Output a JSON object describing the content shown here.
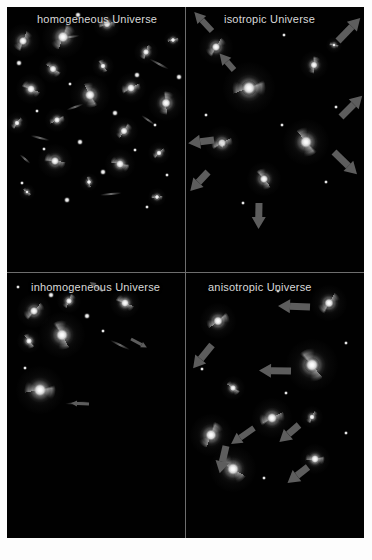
{
  "figure": {
    "background_color": "#000000",
    "frame_color": "#fdfdfd",
    "divider_color": "#6e6e6e",
    "arrow_color": "#5d5d5d",
    "label_color": "#d8d8d8"
  },
  "panels": [
    {
      "id": "homogeneous",
      "label": "homogeneous Universe",
      "galaxies": [
        {
          "x": 16,
          "y": 34,
          "r": 11,
          "rot": 20
        },
        {
          "x": 56,
          "y": 30,
          "r": 14,
          "rot": 200
        },
        {
          "x": 100,
          "y": 17,
          "r": 9,
          "rot": 70
        },
        {
          "x": 96,
          "y": 59,
          "r": 7,
          "rot": 140
        },
        {
          "x": 46,
          "y": 62,
          "r": 9,
          "rot": 300
        },
        {
          "x": 139,
          "y": 45,
          "r": 8,
          "rot": 15
        },
        {
          "x": 166,
          "y": 33,
          "r": 6,
          "rot": 250
        },
        {
          "x": 24,
          "y": 82,
          "r": 10,
          "rot": 110
        },
        {
          "x": 83,
          "y": 88,
          "r": 13,
          "rot": 330
        },
        {
          "x": 124,
          "y": 81,
          "r": 10,
          "rot": 60
        },
        {
          "x": 159,
          "y": 96,
          "r": 12,
          "rot": 175
        },
        {
          "x": 50,
          "y": 113,
          "r": 8,
          "rot": 240
        },
        {
          "x": 10,
          "y": 116,
          "r": 7,
          "rot": 30
        },
        {
          "x": 117,
          "y": 124,
          "r": 9,
          "rot": 210
        },
        {
          "x": 48,
          "y": 154,
          "r": 11,
          "rot": 95
        },
        {
          "x": 113,
          "y": 157,
          "r": 10,
          "rot": 280
        },
        {
          "x": 152,
          "y": 146,
          "r": 7,
          "rot": 40
        },
        {
          "x": 82,
          "y": 175,
          "r": 6,
          "rot": 160
        },
        {
          "x": 20,
          "y": 185,
          "r": 5,
          "rot": 300
        },
        {
          "x": 150,
          "y": 190,
          "r": 6,
          "rot": 80
        }
      ],
      "stars": [
        {
          "x": 71,
          "y": 8,
          "s": 3
        },
        {
          "x": 12,
          "y": 56,
          "s": 3
        },
        {
          "x": 130,
          "y": 68,
          "s": 3
        },
        {
          "x": 63,
          "y": 77,
          "s": 2
        },
        {
          "x": 172,
          "y": 70,
          "s": 3
        },
        {
          "x": 30,
          "y": 104,
          "s": 2
        },
        {
          "x": 108,
          "y": 106,
          "s": 3
        },
        {
          "x": 148,
          "y": 118,
          "s": 2
        },
        {
          "x": 73,
          "y": 135,
          "s": 3
        },
        {
          "x": 37,
          "y": 142,
          "s": 2
        },
        {
          "x": 128,
          "y": 143,
          "s": 2
        },
        {
          "x": 96,
          "y": 165,
          "s": 3
        },
        {
          "x": 160,
          "y": 168,
          "s": 2
        },
        {
          "x": 15,
          "y": 176,
          "s": 2
        },
        {
          "x": 60,
          "y": 193,
          "s": 3
        },
        {
          "x": 140,
          "y": 200,
          "s": 2
        }
      ],
      "streaks": [
        {
          "x": 63,
          "y": 30,
          "len": 20,
          "rot": -8
        },
        {
          "x": 152,
          "y": 57,
          "len": 22,
          "rot": 28
        },
        {
          "x": 68,
          "y": 100,
          "len": 18,
          "rot": -20
        },
        {
          "x": 33,
          "y": 131,
          "len": 20,
          "rot": 14
        },
        {
          "x": 141,
          "y": 113,
          "len": 16,
          "rot": 35
        },
        {
          "x": 104,
          "y": 187,
          "len": 22,
          "rot": -6
        },
        {
          "x": 18,
          "y": 152,
          "len": 14,
          "rot": 40
        }
      ],
      "arrows": []
    },
    {
      "id": "isotropic",
      "label": "isotropic Universe",
      "galaxies": [
        {
          "x": 30,
          "y": 40,
          "r": 11,
          "rot": 30
        },
        {
          "x": 128,
          "y": 58,
          "r": 9,
          "rot": 180
        },
        {
          "x": 63,
          "y": 81,
          "r": 17,
          "rot": 250
        },
        {
          "x": 36,
          "y": 136,
          "r": 11,
          "rot": 60
        },
        {
          "x": 120,
          "y": 135,
          "r": 15,
          "rot": 320
        },
        {
          "x": 78,
          "y": 172,
          "r": 11,
          "rot": 140
        },
        {
          "x": 37,
          "y": 137,
          "r": 4,
          "rot": 0
        },
        {
          "x": 148,
          "y": 38,
          "r": 5,
          "rot": 90
        }
      ],
      "stars": [
        {
          "x": 98,
          "y": 28,
          "s": 2
        },
        {
          "x": 150,
          "y": 100,
          "s": 2
        },
        {
          "x": 20,
          "y": 108,
          "s": 2
        },
        {
          "x": 96,
          "y": 118,
          "s": 2
        },
        {
          "x": 140,
          "y": 175,
          "s": 2
        },
        {
          "x": 57,
          "y": 196,
          "s": 2
        }
      ],
      "streaks": [],
      "arrows": [
        {
          "x": 26,
          "y": 24,
          "len": 26,
          "rot": -133,
          "w": 6,
          "hw": 11
        },
        {
          "x": 152,
          "y": 34,
          "len": 32,
          "rot": -46,
          "w": 7,
          "hw": 12
        },
        {
          "x": 48,
          "y": 63,
          "len": 22,
          "rot": -131,
          "w": 6,
          "hw": 11
        },
        {
          "x": 155,
          "y": 110,
          "len": 30,
          "rot": -45,
          "w": 7,
          "hw": 12
        },
        {
          "x": 28,
          "y": 133,
          "len": 26,
          "rot": 173,
          "w": 7,
          "hw": 12
        },
        {
          "x": 22,
          "y": 165,
          "len": 26,
          "rot": 133,
          "w": 7,
          "hw": 12
        },
        {
          "x": 148,
          "y": 145,
          "len": 32,
          "rot": 44,
          "w": 7,
          "hw": 12
        },
        {
          "x": 73,
          "y": 196,
          "len": 26,
          "rot": 91,
          "w": 7,
          "hw": 12
        }
      ]
    },
    {
      "id": "inhomogeneous",
      "label": "inhomogeneous Universe",
      "galaxies": [
        {
          "x": 27,
          "y": 38,
          "r": 11,
          "rot": 40
        },
        {
          "x": 62,
          "y": 28,
          "r": 8,
          "rot": 200
        },
        {
          "x": 118,
          "y": 30,
          "r": 10,
          "rot": 110
        },
        {
          "x": 22,
          "y": 68,
          "r": 8,
          "rot": 320
        },
        {
          "x": 55,
          "y": 62,
          "r": 15,
          "rot": 150
        },
        {
          "x": 33,
          "y": 117,
          "r": 16,
          "rot": 260
        }
      ],
      "stars": [
        {
          "x": 44,
          "y": 22,
          "s": 3
        },
        {
          "x": 80,
          "y": 43,
          "s": 3
        },
        {
          "x": 11,
          "y": 14,
          "s": 2
        },
        {
          "x": 96,
          "y": 58,
          "s": 2
        },
        {
          "x": 18,
          "y": 95,
          "s": 2
        }
      ],
      "streaks": [
        {
          "x": 113,
          "y": 72,
          "len": 22,
          "rot": 26
        },
        {
          "x": 70,
          "y": 130,
          "len": 24,
          "rot": -4
        }
      ],
      "arrows": [
        {
          "x": 124,
          "y": 66,
          "len": 18,
          "rot": 28,
          "w": 3,
          "hw": 6
        },
        {
          "x": 82,
          "y": 131,
          "len": 18,
          "rot": 182,
          "w": 3,
          "hw": 6
        },
        {
          "x": 96,
          "y": 18,
          "len": 16,
          "rot": 214,
          "w": 3,
          "hw": 6
        }
      ]
    },
    {
      "id": "anisotropic",
      "label": "anisotropic Universe",
      "galaxies": [
        {
          "x": 143,
          "y": 30,
          "r": 12,
          "rot": 30
        },
        {
          "x": 32,
          "y": 48,
          "r": 12,
          "rot": 230
        },
        {
          "x": 126,
          "y": 92,
          "r": 17,
          "rot": 140
        },
        {
          "x": 47,
          "y": 115,
          "r": 8,
          "rot": 300
        },
        {
          "x": 86,
          "y": 145,
          "r": 13,
          "rot": 60
        },
        {
          "x": 25,
          "y": 162,
          "r": 14,
          "rot": 200
        },
        {
          "x": 126,
          "y": 144,
          "r": 7,
          "rot": 20
        },
        {
          "x": 47,
          "y": 196,
          "r": 15,
          "rot": 120
        },
        {
          "x": 129,
          "y": 186,
          "r": 10,
          "rot": 260
        }
      ],
      "stars": [
        {
          "x": 92,
          "y": 18,
          "s": 2
        },
        {
          "x": 160,
          "y": 70,
          "s": 2
        },
        {
          "x": 16,
          "y": 96,
          "s": 2
        },
        {
          "x": 100,
          "y": 120,
          "s": 2
        },
        {
          "x": 160,
          "y": 160,
          "s": 2
        },
        {
          "x": 78,
          "y": 205,
          "s": 2
        }
      ],
      "streaks": [],
      "arrows": [
        {
          "x": 124,
          "y": 34,
          "len": 32,
          "rot": 182,
          "w": 7,
          "hw": 12
        },
        {
          "x": 26,
          "y": 72,
          "len": 30,
          "rot": 129,
          "w": 7,
          "hw": 12
        },
        {
          "x": 105,
          "y": 98,
          "len": 32,
          "rot": 181,
          "w": 7,
          "hw": 12
        },
        {
          "x": 68,
          "y": 155,
          "len": 28,
          "rot": 145,
          "w": 6,
          "hw": 11
        },
        {
          "x": 113,
          "y": 152,
          "len": 26,
          "rot": 139,
          "w": 7,
          "hw": 12
        },
        {
          "x": 40,
          "y": 173,
          "len": 28,
          "rot": 103,
          "w": 7,
          "hw": 12
        },
        {
          "x": 122,
          "y": 194,
          "len": 26,
          "rot": 142,
          "w": 7,
          "hw": 12
        }
      ]
    }
  ]
}
